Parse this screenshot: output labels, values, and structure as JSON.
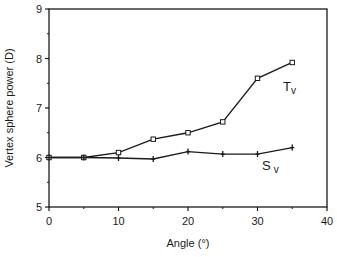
{
  "chart_data": {
    "type": "line",
    "title": "",
    "xlabel": "Angle (°)",
    "ylabel": "Vertex sphere power (D)",
    "xlim": [
      0,
      40
    ],
    "ylim": [
      5,
      9
    ],
    "x_ticks": [
      0,
      10,
      20,
      30,
      40
    ],
    "y_ticks": [
      5,
      6,
      7,
      8,
      9
    ],
    "grid": false,
    "legend": "inline labels",
    "x": [
      0,
      5,
      10,
      15,
      20,
      25,
      30,
      35
    ],
    "series": [
      {
        "name": "Tv",
        "label_main": "T",
        "label_sub": "v",
        "marker": "open-square",
        "values": [
          6.0,
          6.0,
          6.1,
          6.37,
          6.5,
          6.72,
          7.6,
          7.92
        ]
      },
      {
        "name": "Sv",
        "label_main": "S",
        "label_sub": "v",
        "marker": "plus",
        "values": [
          6.0,
          6.0,
          5.99,
          5.97,
          6.12,
          6.07,
          6.07,
          6.2
        ]
      }
    ]
  },
  "labels": {
    "x_axis": "Angle (°)",
    "y_axis": "Vertex sphere power (D)",
    "x_tick_labels": [
      "0",
      "10",
      "20",
      "30",
      "40"
    ],
    "y_tick_labels": [
      "5",
      "6",
      "7",
      "8",
      "9"
    ],
    "tv_main": "T",
    "tv_sub": "v",
    "sv_main": "S",
    "sv_sub": "v"
  }
}
